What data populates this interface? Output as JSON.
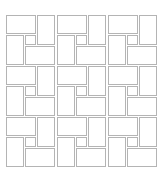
{
  "diagram": {
    "title": "",
    "pattern": "pinwheel rectangle tiling",
    "grid": {
      "cols": 3,
      "rows": 3,
      "cell_size": 51,
      "origin_x": 5,
      "origin_y": 14
    },
    "cell_tiles": [
      {
        "name": "horizontal-top-left",
        "x": 1,
        "y": 1,
        "w": 30,
        "h": 19
      },
      {
        "name": "vertical-top-right",
        "x": 32,
        "y": 1,
        "w": 18,
        "h": 30
      },
      {
        "name": "vertical-bottom-left",
        "x": 1,
        "y": 21,
        "w": 18,
        "h": 30
      },
      {
        "name": "center-square",
        "x": 20,
        "y": 21,
        "w": 11,
        "h": 10
      },
      {
        "name": "horizontal-bottom-right",
        "x": 20,
        "y": 32,
        "w": 30,
        "h": 19
      }
    ],
    "colors": {
      "background": "#ffffff",
      "tile_fill": "#ffffff",
      "tile_border": "#b4b4b4"
    },
    "border_width": 1
  }
}
